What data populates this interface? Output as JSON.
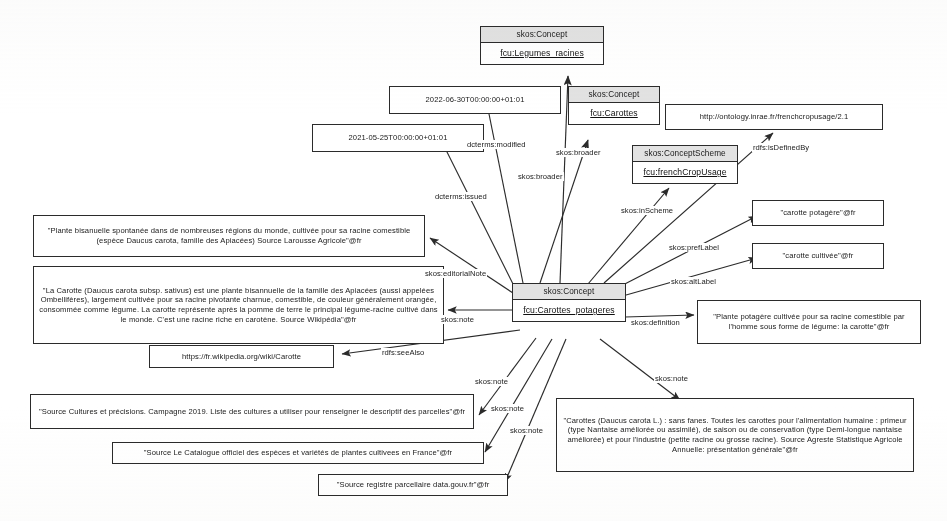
{
  "diagram": {
    "type": "rdf-graph"
  },
  "class_nodes": [
    {
      "id": "legumes_racines",
      "header": "skos:Concept",
      "uri": "fcu:Legumes_racines"
    },
    {
      "id": "carottes",
      "header": "skos:Concept",
      "uri": "fcu:Carottes"
    },
    {
      "id": "scheme",
      "header": "skos:ConceptScheme",
      "uri": "fcu:frenchCropUsage"
    },
    {
      "id": "center",
      "header": "skos:Concept",
      "uri": "fcu:Carottes_potageres"
    }
  ],
  "literal_nodes": [
    {
      "id": "modified",
      "text": "2022-06-30T00:00:00+01:01"
    },
    {
      "id": "issued",
      "text": "2021-05-25T00:00:00+01:01"
    },
    {
      "id": "definedby",
      "text": "http://ontology.inrae.fr/frenchcropusage/2.1"
    },
    {
      "id": "prefLabel",
      "text": "\"carotte potagère\"@fr"
    },
    {
      "id": "altLabel",
      "text": "\"carotte cultivée\"@fr"
    },
    {
      "id": "editorialNote",
      "text": "\"Plante bisanuelle spontanée dans de nombreuses régions du monde, cultivée pour sa racine comestible (espèce Daucus carota, famille des Apiacées) Source Larousse Agricole\"@fr"
    },
    {
      "id": "noteWikipedia",
      "text": "\"La Carotte (Daucus carota subsp. sativus) est une plante bisannuelle de la famille des Apiacées (aussi appelées Ombellifères), largement cultivée pour sa racine pivotante charnue, comestible, de couleur généralement orangée, consommée comme légume. La carotte représente après la pomme de terre le principal légume-racine cultivé dans le monde. C'est une racine riche en carotène. Source Wikipédia\"@fr"
    },
    {
      "id": "seeAlso",
      "text": "https://fr.wikipedia.org/wiki/Carotte"
    },
    {
      "id": "definition",
      "text": "\"Plante potagère cultivée pour sa racine comestible par l'homme sous forme de légume: la carotte\"@fr"
    },
    {
      "id": "noteCultures",
      "text": "\"Source Cultures et précisions. Campagne 2019. Liste des cultures a utiliser pour renseigner le descriptif des parcelles\"@fr"
    },
    {
      "id": "noteCatalogue",
      "text": "\"Source Le Catalogue officiel des espèces et variétés de plantes cultivees en France\"@fr"
    },
    {
      "id": "noteRegistre",
      "text": "\"Source registre parcellaire data.gouv.fr\"@fr"
    },
    {
      "id": "noteAgreste",
      "text": "\"Carottes (Daucus carota L.) : sans fanes. Toutes les carottes pour l'alimentation humaine : primeur (type Nantaise améliorée ou assimilé), de saison ou de conservation (type Demi-longue nantaise améliorée) et pour l'industrie (petite racine ou grosse racine). Source Agreste Statistique Agricole Annuelle: présentation générale\"@fr"
    }
  ],
  "edge_labels": [
    {
      "id": "e_modified",
      "text": "dcterms:modified"
    },
    {
      "id": "e_issued",
      "text": "dcterms:issued"
    },
    {
      "id": "e_broader1",
      "text": "skos:broader"
    },
    {
      "id": "e_broader2",
      "text": "skos:broader"
    },
    {
      "id": "e_definedby",
      "text": "rdfs:isDefinedBy"
    },
    {
      "id": "e_inScheme",
      "text": "skos:inScheme"
    },
    {
      "id": "e_prefLabel",
      "text": "skos:prefLabel"
    },
    {
      "id": "e_altLabel",
      "text": "skos:altLabel"
    },
    {
      "id": "e_definition",
      "text": "skos:definition"
    },
    {
      "id": "e_editorialNote",
      "text": "skos:editorialNote"
    },
    {
      "id": "e_note1",
      "text": "skos:note"
    },
    {
      "id": "e_seeAlso",
      "text": "rdfs:seeAlso"
    },
    {
      "id": "e_note2",
      "text": "skos:note"
    },
    {
      "id": "e_note3",
      "text": "skos:note"
    },
    {
      "id": "e_note4",
      "text": "skos:note"
    },
    {
      "id": "e_note5",
      "text": "skos:note"
    }
  ],
  "colors": {
    "stroke": "#2b2b2b",
    "header_fill": "#e2e2e2",
    "background": "#ffffff",
    "text": "#191919"
  }
}
